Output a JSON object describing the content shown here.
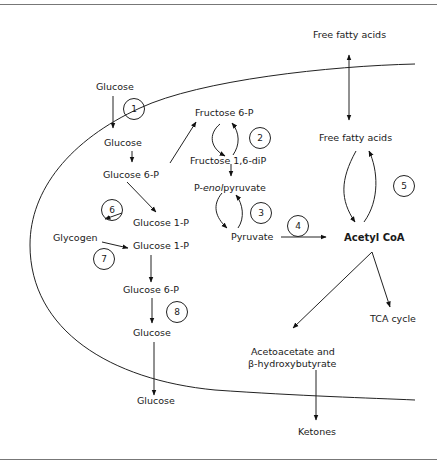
{
  "diagram": {
    "labels": {
      "glucose_ext_top": "Glucose",
      "glucose_in": "Glucose",
      "glucose_6p_a": "Glucose  6-P",
      "glucose_1p_a": "Glucose  1-P",
      "glycogen": "Glycogen",
      "glucose_1p_b": "Glucose  1-P",
      "glucose_6p_b": "Glucose  6-P",
      "glucose_out_in": "Glucose",
      "glucose_ext_bottom": "Glucose",
      "fructose_6p": "Fructose  6-P",
      "fructose_16dip": "Fructose  1,6-diP",
      "pep_prefix": "P-",
      "pep_italic": "enol",
      "pep_suffix": "pyruvate",
      "pyruvate": "Pyruvate",
      "acetyl_coa": "Acetyl CoA",
      "ffa_ext": "Free fatty acids",
      "ffa_in": "Free fatty acids",
      "tca": "TCA cycle",
      "acetoacetate_line1": "Acetoacetate and",
      "acetoacetate_line2": "β-hydroxybutyrate",
      "ketones": "Ketones"
    },
    "steps": [
      "1",
      "2",
      "3",
      "4",
      "5",
      "6",
      "7",
      "8"
    ]
  }
}
